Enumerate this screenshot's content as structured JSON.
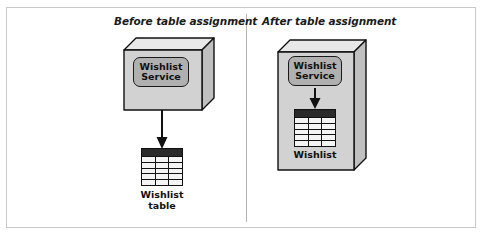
{
  "figure": {
    "panels": [
      {
        "id": "before",
        "title": "Before table assignment",
        "service": {
          "line1": "Wishlist",
          "line2": "Service"
        },
        "table": {
          "columns": 3,
          "rows": 5,
          "header": true
        },
        "caption": {
          "line1": "Wishlist",
          "line2": "table"
        },
        "arrow": {
          "from": "service",
          "to": "table",
          "direction": "down"
        },
        "table_inside_service_box": false
      },
      {
        "id": "after",
        "title": "After table assignment",
        "service": {
          "line1": "Wishlist",
          "line2": "Service"
        },
        "table": {
          "columns": 3,
          "rows": 5,
          "header": true
        },
        "caption": {
          "line1": "Wishlist",
          "line2": ""
        },
        "arrow": {
          "from": "service",
          "to": "table",
          "direction": "down"
        },
        "table_inside_service_box": true
      }
    ],
    "colors": {
      "box_front": "#d2d2d2",
      "box_top": "#e8e8e8",
      "box_side": "#c0c0c0",
      "service_fill": "#b0b0b0",
      "table_header": "#2a2a2a",
      "outline": "#111111",
      "frame_border": "#c9c9c9",
      "divider": "#b4b4b4",
      "background": "#ffffff"
    }
  }
}
